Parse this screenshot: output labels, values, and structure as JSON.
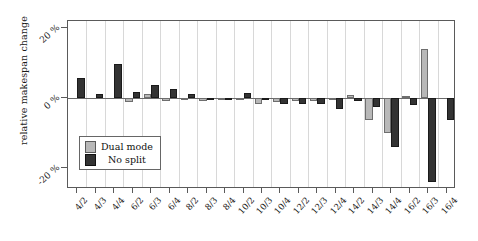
{
  "chart_data": {
    "type": "bar",
    "title": "",
    "subtitle": "",
    "xlabel": "",
    "ylabel": "relative makespan change",
    "ylim": [
      -26,
      22
    ],
    "yticks": [
      20,
      0,
      -20
    ],
    "ytick_labels": [
      "20 %",
      "0 %",
      "-20 %"
    ],
    "grid": "vertical",
    "legend_position": "inside lower-left",
    "categories": [
      "4/2",
      "4/3",
      "4/4",
      "6/2",
      "6/3",
      "6/4",
      "8/2",
      "8/3",
      "8/4",
      "10/2",
      "10/3",
      "10/4",
      "12/2",
      "12/3",
      "12/4",
      "14/2",
      "14/3",
      "14/4",
      "16/2",
      "16/3",
      "16/4"
    ],
    "series": [
      {
        "name": "Dual mode",
        "color": "#b8b8b8",
        "values": [
          0,
          0,
          0,
          -1.2,
          1.2,
          -0.8,
          -0.6,
          -0.8,
          -0.4,
          -0.2,
          -1.8,
          -1.0,
          -0.8,
          -0.8,
          -0.6,
          0.9,
          -6.2,
          -10.0,
          0.7,
          14.0,
          0
        ]
      },
      {
        "name": "No split",
        "color": "#333333",
        "values": [
          5.8,
          1.2,
          9.8,
          1.8,
          3.6,
          2.6,
          1.2,
          -0.6,
          -0.6,
          1.5,
          -0.6,
          -1.8,
          -1.8,
          -1.6,
          -3.2,
          -0.8,
          -2.6,
          -14.0,
          -2.0,
          -24.0,
          -6.4
        ]
      }
    ]
  },
  "legend": {
    "items": [
      {
        "label": "Dual mode",
        "swatch": "light-gray-square"
      },
      {
        "label": "No split",
        "swatch": "dark-square"
      }
    ]
  }
}
